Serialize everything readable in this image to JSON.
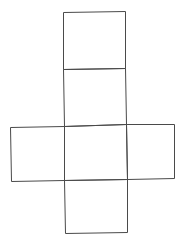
{
  "diagram": {
    "type": "cube-net",
    "background": "#ffffff",
    "stroke_color": "#4a4a4a",
    "stroke_width": 1,
    "faces": [
      {
        "name": "top",
        "points": [
          [
            63,
            12
          ],
          [
            125,
            11
          ],
          [
            125,
            68
          ],
          [
            63,
            69
          ]
        ]
      },
      {
        "name": "upper-middle",
        "points": [
          [
            63,
            69
          ],
          [
            125,
            68
          ],
          [
            126,
            124
          ],
          [
            64,
            126
          ]
        ]
      },
      {
        "name": "left",
        "points": [
          [
            10,
            127
          ],
          [
            64,
            126
          ],
          [
            64,
            180
          ],
          [
            11,
            181
          ]
        ]
      },
      {
        "name": "center",
        "points": [
          [
            64,
            126
          ],
          [
            126,
            124
          ],
          [
            127,
            179
          ],
          [
            64,
            180
          ]
        ]
      },
      {
        "name": "right",
        "points": [
          [
            126,
            124
          ],
          [
            174,
            124
          ],
          [
            174,
            178
          ],
          [
            127,
            179
          ]
        ]
      },
      {
        "name": "bottom",
        "points": [
          [
            64,
            180
          ],
          [
            127,
            179
          ],
          [
            127,
            232
          ],
          [
            65,
            233
          ]
        ]
      }
    ]
  }
}
